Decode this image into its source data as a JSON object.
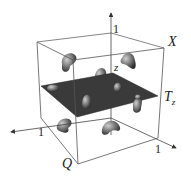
{
  "diagram": {
    "type": "3d-cube-with-slice-plane",
    "labels": {
      "top_axis_tick": "1",
      "x_label": "X",
      "z_label": "z",
      "plane_label": "T",
      "plane_label_sub": "z",
      "left_axis_tick": "1",
      "right_axis_tick": "1",
      "origin_label": "Q"
    },
    "colors": {
      "edges": "#555555",
      "plane": "#3a3a3a",
      "blobs": "#7a7a7a",
      "text": "#222222"
    }
  }
}
